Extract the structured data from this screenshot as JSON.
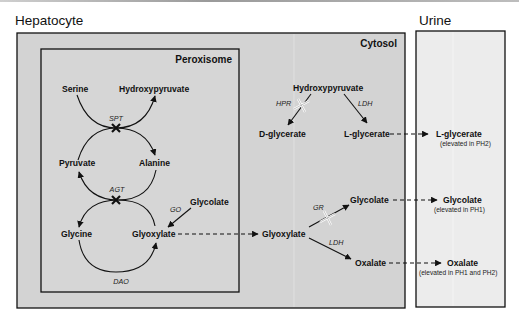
{
  "regions": {
    "hepatocyte": {
      "title": "Hepatocyte",
      "fill": "#d3d3d3"
    },
    "urine": {
      "title": "Urine",
      "fill": "#ececec"
    },
    "peroxisome": {
      "title": "Peroxisome"
    },
    "cytosol": {
      "title": "Cytosol"
    }
  },
  "peroxisome": {
    "metabolites": {
      "serine": "Serine",
      "hydroxypyruvate": "Hydroxypyruvate",
      "pyruvate": "Pyruvate",
      "alanine": "Alanine",
      "glycine": "Glycine",
      "glyoxylate": "Glyoxylate",
      "glycolate": "Glycolate"
    },
    "enzymes": {
      "spt": "SPT",
      "agt": "AGT",
      "go": "GO",
      "dao": "DAO"
    }
  },
  "cytosol": {
    "metabolites": {
      "hydroxypyruvate": "Hydroxypyruvate",
      "d_glycerate": "D-glycerate",
      "l_glycerate": "L-glycerate",
      "glyoxylate": "Glyoxylate",
      "glycolate": "Glycolate",
      "oxalate": "Oxalate"
    },
    "enzymes": {
      "hpr": "HPR",
      "ldh_top": "LDH",
      "gr": "GR",
      "ldh_bottom": "LDH"
    }
  },
  "urine": {
    "items": [
      {
        "name": "L-glycerate",
        "note": "(elevated in PH2)"
      },
      {
        "name": "Glycolate",
        "note": "(elevated in PH1)"
      },
      {
        "name": "Oxalate",
        "note": "(elevated in PH1 and PH2)"
      }
    ]
  },
  "markers": {
    "blocked": "black-x-icon",
    "deficient": "open-cross-icon"
  }
}
